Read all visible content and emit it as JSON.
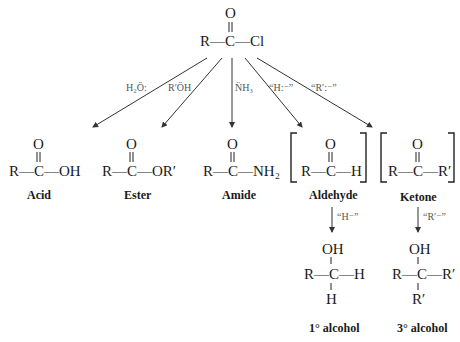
{
  "start": {
    "text": "R—C—Cl",
    "carbonyl_o": "O"
  },
  "reagents": [
    {
      "label": "H₂Ö:",
      "to": "Acid"
    },
    {
      "label": "R′ÖH",
      "to": "Ester"
    },
    {
      "label": "N̈H₃",
      "to": "Amide"
    },
    {
      "label": "“H:⁻”",
      "to": "Aldehyde"
    },
    {
      "label": "“R′:⁻”",
      "to": "Ketone"
    }
  ],
  "products": [
    {
      "name": "Acid",
      "formula": "R—C—OH",
      "o": "O"
    },
    {
      "name": "Ester",
      "formula": "R—C—OR′",
      "o": "O"
    },
    {
      "name": "Amide",
      "formula": "R—C—NH₂",
      "o": "O"
    },
    {
      "name": "Aldehyde",
      "formula": "R—C—H",
      "o": "O",
      "bracketed": true
    },
    {
      "name": "Ketone",
      "formula": "R—C—R′",
      "o": "O",
      "bracketed": true
    }
  ],
  "second_step": [
    {
      "reagent": "“H⁻”",
      "product": "1° alcohol",
      "top": "OH",
      "mid": "R—C—H",
      "bottom": "H"
    },
    {
      "reagent": "“R′⁻”",
      "product": "3° alcohol",
      "top": "OH",
      "mid": "R—C—R′",
      "bottom": "R′"
    }
  ]
}
